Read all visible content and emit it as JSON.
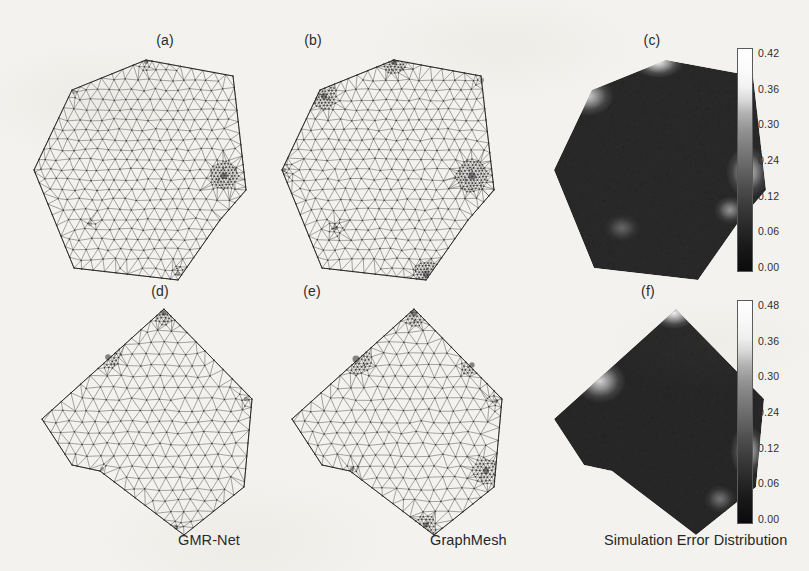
{
  "figure": {
    "width": 809,
    "height": 571,
    "background_color": "#f4f2ee",
    "ink_color": "#2b2b2b"
  },
  "columns": [
    {
      "id": "gmr-net",
      "caption": "GMR-Net",
      "x": 178,
      "y": 532
    },
    {
      "id": "graphmesh",
      "caption": "GraphMesh",
      "x": 430,
      "y": 532
    },
    {
      "id": "simulation-error",
      "caption": "Simulation Error Distribution",
      "x": 604,
      "y": 532
    }
  ],
  "panels": [
    {
      "id": "a",
      "label": "(a)",
      "type": "mesh",
      "method": "GMR-Net",
      "shape": "heptagon",
      "label_x": 135,
      "label_y": 32,
      "origin_x": 28,
      "origin_y": 52
    },
    {
      "id": "b",
      "label": "(b)",
      "type": "mesh",
      "method": "GraphMesh",
      "shape": "heptagon",
      "label_x": 283,
      "label_y": 32,
      "origin_x": 276,
      "origin_y": 52
    },
    {
      "id": "c",
      "label": "(c)",
      "type": "heatmap",
      "method": "Simulation Error Distribution",
      "shape": "heptagon",
      "label_x": 622,
      "label_y": 32,
      "origin_x": 548,
      "origin_y": 52
    },
    {
      "id": "d",
      "label": "(d)",
      "type": "mesh",
      "method": "GMR-Net",
      "shape": "quadrilateral-notched",
      "label_x": 130,
      "label_y": 283,
      "origin_x": 36,
      "origin_y": 303
    },
    {
      "id": "e",
      "label": "(e)",
      "type": "mesh",
      "method": "GraphMesh",
      "shape": "quadrilateral-notched",
      "label_x": 282,
      "label_y": 283,
      "origin_x": 286,
      "origin_y": 303
    },
    {
      "id": "f",
      "label": "(f)",
      "type": "heatmap",
      "method": "Simulation Error Distribution",
      "shape": "quadrilateral-notched",
      "label_x": 618,
      "label_y": 283,
      "origin_x": 548,
      "origin_y": 303
    }
  ],
  "chart_data": [
    {
      "type": "heatmap",
      "panel": "c",
      "title": "(c)",
      "quantity": "Simulation Error",
      "colormap": "grayscale-inverted",
      "cmin": 0.0,
      "cmax": 0.42,
      "colorbar_ticks": [
        "0.42",
        "0.36",
        "0.30",
        "0.24",
        "0.12",
        "0.06",
        "0.00"
      ],
      "colorbar_tick_values": [
        0.42,
        0.36,
        0.3,
        0.24,
        0.12,
        0.06,
        0.0
      ],
      "colorbar_x": 737,
      "colorbar_y": 48,
      "colorbar_height": 222,
      "domain_outline": [
        [
          118,
          8
        ],
        [
          205,
          24
        ],
        [
          218,
          138
        ],
        [
          192,
          168
        ],
        [
          150,
          228
        ],
        [
          46,
          216
        ],
        [
          6,
          118
        ],
        [
          44,
          38
        ]
      ],
      "hotspots": [
        {
          "cx": 110,
          "cy": 10,
          "rx": 26,
          "ry": 16,
          "value": 0.42,
          "label": "top-vertex peak error"
        },
        {
          "cx": 40,
          "cy": 44,
          "rx": 26,
          "ry": 20,
          "value": 0.34,
          "label": "upper-left edge error"
        },
        {
          "cx": 200,
          "cy": 120,
          "rx": 22,
          "ry": 26,
          "value": 0.32,
          "label": "right edge error"
        },
        {
          "cx": 182,
          "cy": 158,
          "rx": 16,
          "ry": 14,
          "value": 0.22,
          "label": "lower-right notch error"
        },
        {
          "cx": 74,
          "cy": 176,
          "rx": 18,
          "ry": 14,
          "value": 0.13,
          "label": "lower-left mild error"
        }
      ],
      "background_value": 0.02,
      "grid": false,
      "legend_position": "right"
    },
    {
      "type": "heatmap",
      "panel": "f",
      "title": "(f)",
      "quantity": "Simulation Error",
      "colormap": "grayscale-inverted",
      "cmin": 0.0,
      "cmax": 0.48,
      "colorbar_ticks": [
        "0.48",
        "0.36",
        "0.30",
        "0.24",
        "0.12",
        "0.06",
        "0.00"
      ],
      "colorbar_tick_values": [
        0.48,
        0.36,
        0.3,
        0.24,
        0.12,
        0.06,
        0.0
      ],
      "colorbar_x": 737,
      "colorbar_y": 300,
      "colorbar_height": 222,
      "domain_outline": [
        [
          128,
          6
        ],
        [
          216,
          96
        ],
        [
          208,
          184
        ],
        [
          148,
          232
        ],
        [
          64,
          168
        ],
        [
          36,
          162
        ],
        [
          6,
          116
        ]
      ],
      "hotspots": [
        {
          "cx": 126,
          "cy": 10,
          "rx": 24,
          "ry": 16,
          "value": 0.48,
          "label": "top-vertex peak error"
        },
        {
          "cx": 52,
          "cy": 78,
          "rx": 26,
          "ry": 22,
          "value": 0.4,
          "label": "upper-left edge error"
        },
        {
          "cx": 200,
          "cy": 148,
          "rx": 18,
          "ry": 26,
          "value": 0.36,
          "label": "right edge error"
        },
        {
          "cx": 172,
          "cy": 196,
          "rx": 16,
          "ry": 14,
          "value": 0.18,
          "label": "lower-right mild error"
        }
      ],
      "background_value": 0.02,
      "grid": false,
      "legend_position": "right"
    }
  ],
  "mesh_specs": {
    "heptagon_outline": [
      [
        118,
        8
      ],
      [
        205,
        24
      ],
      [
        218,
        138
      ],
      [
        192,
        168
      ],
      [
        150,
        228
      ],
      [
        46,
        216
      ],
      [
        6,
        118
      ],
      [
        44,
        38
      ]
    ],
    "quad_outline": [
      [
        128,
        6
      ],
      [
        216,
        96
      ],
      [
        208,
        184
      ],
      [
        148,
        232
      ],
      [
        64,
        168
      ],
      [
        36,
        162
      ],
      [
        6,
        116
      ]
    ],
    "panel_a_refinement": [
      {
        "cx": 196,
        "cy": 124,
        "r": 15,
        "density": "high"
      },
      {
        "cx": 118,
        "cy": 10,
        "r": 9,
        "density": "medium"
      },
      {
        "cx": 46,
        "cy": 40,
        "r": 7,
        "density": "low"
      },
      {
        "cx": 150,
        "cy": 222,
        "r": 8,
        "density": "medium"
      },
      {
        "cx": 62,
        "cy": 172,
        "r": 6,
        "density": "low"
      }
    ],
    "panel_b_refinement": [
      {
        "cx": 196,
        "cy": 124,
        "r": 17,
        "density": "high"
      },
      {
        "cx": 118,
        "cy": 10,
        "r": 13,
        "density": "high"
      },
      {
        "cx": 48,
        "cy": 44,
        "r": 14,
        "density": "high"
      },
      {
        "cx": 150,
        "cy": 222,
        "r": 14,
        "density": "high"
      },
      {
        "cx": 8,
        "cy": 118,
        "r": 10,
        "density": "medium"
      },
      {
        "cx": 60,
        "cy": 176,
        "r": 9,
        "density": "medium"
      },
      {
        "cx": 206,
        "cy": 28,
        "r": 9,
        "density": "medium"
      }
    ],
    "panel_d_refinement": [
      {
        "cx": 128,
        "cy": 10,
        "r": 12,
        "density": "high"
      },
      {
        "cx": 72,
        "cy": 54,
        "r": 13,
        "density": "high"
      },
      {
        "cx": 210,
        "cy": 96,
        "r": 9,
        "density": "medium"
      },
      {
        "cx": 140,
        "cy": 224,
        "r": 10,
        "density": "medium"
      },
      {
        "cx": 66,
        "cy": 166,
        "r": 6,
        "density": "low"
      }
    ],
    "panel_e_refinement": [
      {
        "cx": 128,
        "cy": 10,
        "r": 14,
        "density": "high"
      },
      {
        "cx": 70,
        "cy": 56,
        "r": 16,
        "density": "high"
      },
      {
        "cx": 186,
        "cy": 62,
        "r": 12,
        "density": "high"
      },
      {
        "cx": 210,
        "cy": 98,
        "r": 10,
        "density": "medium"
      },
      {
        "cx": 200,
        "cy": 168,
        "r": 14,
        "density": "high"
      },
      {
        "cx": 140,
        "cy": 222,
        "r": 12,
        "density": "high"
      },
      {
        "cx": 66,
        "cy": 166,
        "r": 8,
        "density": "medium"
      }
    ]
  }
}
